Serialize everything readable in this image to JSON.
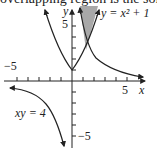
{
  "caption": "overlapping region is the solid",
  "graph": {
    "x_axis_label": "x",
    "y_axis_label": "y",
    "x_tick_labels": {
      "neg": "−5",
      "pos": "5"
    },
    "y_tick_labels": {
      "pos": "5",
      "neg": "−5"
    },
    "curves": [
      {
        "name": "parabola",
        "label": "y = x² + 1"
      },
      {
        "name": "hyperbola",
        "label": "xy = 4"
      }
    ],
    "shaded_region_color": "#a8a8a8",
    "line_color": "#222222"
  }
}
